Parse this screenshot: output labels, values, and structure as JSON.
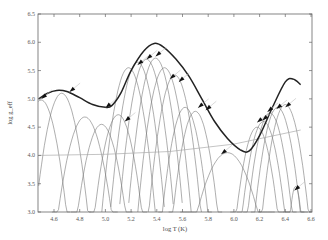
{
  "chart_data": {
    "type": "line",
    "title": "",
    "xlabel": "log T (K)",
    "ylabel": "log g_eff",
    "xlim": [
      4.48,
      6.6
    ],
    "ylim": [
      3.0,
      6.5
    ],
    "x_ticks": [
      "4.6",
      "4.8",
      "5.0",
      "5.2",
      "5.4",
      "5.6",
      "5.8",
      "6.0",
      "6.2",
      "6.4",
      "6.6"
    ],
    "y_ticks": [
      "3.0",
      "3.5",
      "4.0",
      "4.5",
      "5.0",
      "5.5",
      "6.0",
      "6.5"
    ],
    "grid": false,
    "legend": null,
    "series": [
      {
        "name": "envelope",
        "style": "thick",
        "x": [
          4.48,
          4.55,
          4.62,
          4.7,
          4.8,
          4.9,
          5.0,
          5.05,
          5.12,
          5.2,
          5.3,
          5.38,
          5.45,
          5.55,
          5.65,
          5.75,
          5.85,
          5.95,
          6.05,
          6.12,
          6.2,
          6.3,
          6.4,
          6.46,
          6.52
        ],
        "y": [
          5.0,
          5.1,
          5.15,
          5.13,
          5.02,
          4.9,
          4.85,
          4.88,
          5.1,
          5.5,
          5.85,
          5.98,
          5.92,
          5.7,
          5.4,
          5.0,
          4.6,
          4.3,
          4.1,
          4.08,
          4.35,
          4.85,
          5.3,
          5.35,
          5.25
        ]
      },
      {
        "name": "reference",
        "style": "thin-gray",
        "x": [
          4.48,
          5.0,
          5.5,
          6.0,
          6.52
        ],
        "y": [
          4.0,
          4.02,
          4.07,
          4.2,
          4.45
        ]
      }
    ],
    "arches": [
      {
        "center": 4.5,
        "peak": 4.98,
        "half_width": 0.14
      },
      {
        "center": 4.66,
        "peak": 5.1,
        "half_width": 0.14
      },
      {
        "center": 4.84,
        "peak": 4.68,
        "half_width": 0.16
      },
      {
        "center": 4.97,
        "peak": 4.55,
        "half_width": 0.15
      },
      {
        "center": 5.1,
        "peak": 4.72,
        "half_width": 0.14
      },
      {
        "center": 5.18,
        "peak": 5.55,
        "half_width": 0.13
      },
      {
        "center": 5.25,
        "peak": 5.65,
        "half_width": 0.13
      },
      {
        "center": 5.32,
        "peak": 5.7,
        "half_width": 0.13
      },
      {
        "center": 5.39,
        "peak": 5.72,
        "half_width": 0.13
      },
      {
        "center": 5.46,
        "peak": 5.55,
        "half_width": 0.13
      },
      {
        "center": 5.54,
        "peak": 5.42,
        "half_width": 0.13
      },
      {
        "center": 5.62,
        "peak": 4.85,
        "half_width": 0.13
      },
      {
        "center": 5.7,
        "peak": 4.78,
        "half_width": 0.13
      },
      {
        "center": 5.95,
        "peak": 4.05,
        "half_width": 0.23
      },
      {
        "center": 6.18,
        "peak": 4.5,
        "half_width": 0.13
      },
      {
        "center": 6.23,
        "peak": 4.6,
        "half_width": 0.13
      },
      {
        "center": 6.28,
        "peak": 4.75,
        "half_width": 0.13
      },
      {
        "center": 6.34,
        "peak": 4.85,
        "half_width": 0.13
      },
      {
        "center": 6.4,
        "peak": 4.9,
        "half_width": 0.13
      },
      {
        "center": 6.48,
        "peak": 3.45,
        "half_width": 0.06
      }
    ],
    "arrow_markers": [
      {
        "x": 4.5,
        "y": 5.0
      },
      {
        "x": 4.72,
        "y": 5.12
      },
      {
        "x": 5.0,
        "y": 4.84
      },
      {
        "x": 5.15,
        "y": 4.6
      },
      {
        "x": 5.25,
        "y": 5.6
      },
      {
        "x": 5.32,
        "y": 5.7
      },
      {
        "x": 5.39,
        "y": 5.75
      },
      {
        "x": 5.5,
        "y": 5.35
      },
      {
        "x": 5.57,
        "y": 5.3
      },
      {
        "x": 5.72,
        "y": 4.84
      },
      {
        "x": 5.78,
        "y": 4.8
      },
      {
        "x": 5.9,
        "y": 4.02
      },
      {
        "x": 6.18,
        "y": 4.58
      },
      {
        "x": 6.22,
        "y": 4.62
      },
      {
        "x": 6.26,
        "y": 4.77
      },
      {
        "x": 6.33,
        "y": 4.82
      },
      {
        "x": 6.4,
        "y": 4.85
      },
      {
        "x": 6.47,
        "y": 3.38
      }
    ]
  }
}
